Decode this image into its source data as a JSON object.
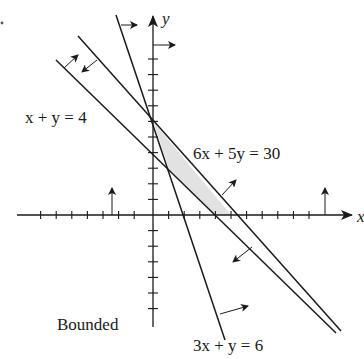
{
  "figure": {
    "title": "Bounded",
    "region_label": "Bounded",
    "axis_labels": {
      "x": "x",
      "y": "y"
    },
    "colors": {
      "line": "#1a1a1a",
      "shade": "#e2e2e2",
      "background": "#ffffff"
    },
    "constraints": [
      {
        "id": "c1",
        "equation": "x + y = 4",
        "direction": "toward upper-right (x + y >= 4)"
      },
      {
        "id": "c2",
        "equation": "6x + 5y = 30",
        "direction": "toward lower-left (6x + 5y <= 30)"
      },
      {
        "id": "c3",
        "equation": "3x + y = 6",
        "direction": "toward right (3x + y >= 6)"
      },
      {
        "id": "c4",
        "equation": "x = 0",
        "direction": "toward right (x >= 0)"
      },
      {
        "id": "c5",
        "equation": "y = 0",
        "direction": "upward (y >= 0)"
      }
    ],
    "feasible_region_vertices": [
      [
        0,
        6
      ],
      [
        1,
        3
      ],
      [
        4,
        0
      ],
      [
        5,
        0
      ]
    ],
    "labels": {
      "c1": "x + y = 4",
      "c2": "6x + 5y = 30",
      "c3": "3x + y = 6",
      "bounded": "Bounded"
    },
    "axis_ticks": {
      "x_range": [
        -7,
        10
      ],
      "y_range": [
        -8,
        11
      ],
      "unit": 1
    }
  }
}
